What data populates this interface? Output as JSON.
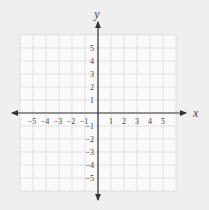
{
  "chart_data": {
    "type": "scatter",
    "title": "",
    "xlabel": "x",
    "ylabel": "y",
    "xlim": [
      -6,
      6
    ],
    "ylim": [
      -6,
      6
    ],
    "grid": true,
    "x_ticks": [
      -5,
      -4,
      -3,
      -2,
      -1,
      1,
      2,
      3,
      4,
      5
    ],
    "y_ticks": [
      5,
      4,
      3,
      2,
      1,
      -1,
      -2,
      -3,
      -4,
      -5
    ],
    "x_tick_labels": [
      "−5",
      "−4",
      "−3",
      "−2",
      "−1",
      "1",
      "2",
      "3",
      "4",
      "5"
    ],
    "y_tick_labels": [
      "5",
      "4",
      "3",
      "2",
      "1",
      "−1",
      "−2",
      "−3",
      "−4",
      "−5"
    ],
    "points": []
  },
  "colors": {
    "background": "#efefef",
    "grid_fill": "#fafafa",
    "grid_line": "#c8c8c8",
    "axis": "#333333",
    "label": "#444444"
  }
}
